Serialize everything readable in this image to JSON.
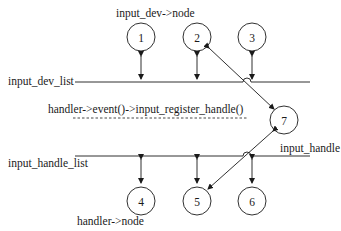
{
  "labels": {
    "top_node": "input_dev->node",
    "dev_list": "input_dev_list",
    "call": "handler->event()->input_register_handle()",
    "handle_list": "input_handle_list",
    "handle": "input_handle",
    "bottom_node": "handler->node"
  },
  "nodes": [
    {
      "id": "1",
      "label": "1",
      "cx": 141,
      "cy": 37
    },
    {
      "id": "2",
      "label": "2",
      "cx": 197,
      "cy": 37
    },
    {
      "id": "3",
      "label": "3",
      "cx": 252,
      "cy": 37
    },
    {
      "id": "4",
      "label": "4",
      "cx": 141,
      "cy": 201
    },
    {
      "id": "5",
      "label": "5",
      "cx": 197,
      "cy": 201
    },
    {
      "id": "6",
      "label": "6",
      "cx": 252,
      "cy": 201
    },
    {
      "id": "7",
      "label": "7",
      "cx": 284,
      "cy": 120
    }
  ],
  "colors": {
    "stroke": "#1a1a1a",
    "background": "#ffffff"
  }
}
